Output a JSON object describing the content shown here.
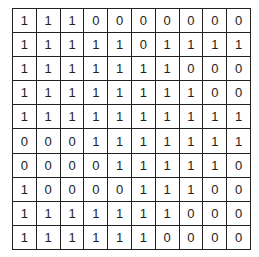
{
  "grid": {
    "rows": [
      [
        1,
        1,
        1,
        0,
        0,
        0,
        0,
        0,
        0,
        0
      ],
      [
        1,
        1,
        1,
        1,
        1,
        0,
        1,
        1,
        1,
        1
      ],
      [
        1,
        1,
        1,
        1,
        1,
        1,
        1,
        0,
        0,
        0
      ],
      [
        1,
        1,
        1,
        1,
        1,
        1,
        1,
        1,
        0,
        0
      ],
      [
        1,
        1,
        1,
        1,
        1,
        1,
        1,
        1,
        1,
        1
      ],
      [
        0,
        0,
        0,
        1,
        1,
        1,
        1,
        1,
        1,
        1
      ],
      [
        0,
        0,
        0,
        0,
        1,
        1,
        1,
        1,
        1,
        0
      ],
      [
        1,
        0,
        0,
        0,
        0,
        1,
        1,
        1,
        0,
        0
      ],
      [
        1,
        1,
        1,
        1,
        1,
        1,
        1,
        0,
        0,
        0
      ],
      [
        1,
        1,
        1,
        1,
        1,
        1,
        0,
        0,
        0,
        0
      ]
    ]
  }
}
